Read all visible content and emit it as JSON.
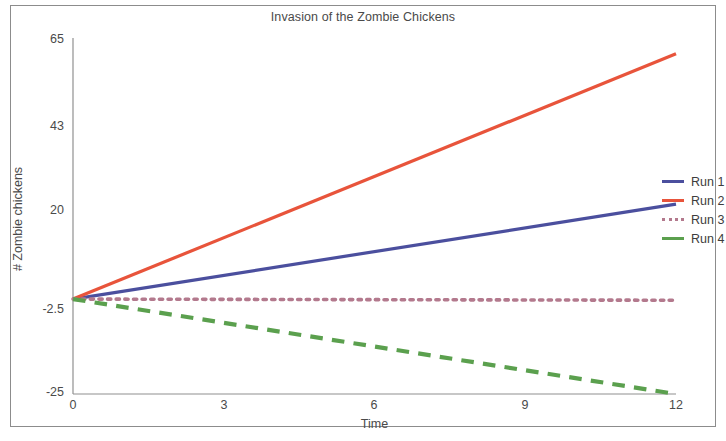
{
  "chart_data": {
    "type": "line",
    "title": "Invasion of the Zombie Chickens",
    "xlabel": "Time",
    "ylabel": "# Zombie chickens",
    "xlim": [
      0,
      12
    ],
    "ylim": [
      -25,
      65
    ],
    "xticks": [
      "0",
      "3",
      "6",
      "9",
      "12"
    ],
    "xtick_values": [
      0,
      3,
      6,
      9,
      12
    ],
    "yticks": [
      "-25",
      "-2.5",
      "20",
      "43",
      "65"
    ],
    "ytick_values": [
      -25,
      -2.5,
      20,
      43,
      65
    ],
    "grid": false,
    "legend_position": "right",
    "x": [
      0,
      12
    ],
    "series": [
      {
        "name": "Run 1",
        "values": [
          -1,
          23
        ],
        "color": "#4b4f9e",
        "style": "solid"
      },
      {
        "name": "Run 2",
        "values": [
          -1,
          61
        ],
        "color": "#e8543b",
        "style": "solid"
      },
      {
        "name": "Run 3",
        "values": [
          -1,
          -1.3
        ],
        "color": "#b3798d",
        "style": "dotted"
      },
      {
        "name": "Run 4",
        "values": [
          -1,
          -25
        ],
        "color": "#5ba04e",
        "style": "dashed"
      }
    ]
  },
  "legend": {
    "items": [
      {
        "label": "Run 1"
      },
      {
        "label": "Run 2"
      },
      {
        "label": "Run 3"
      },
      {
        "label": "Run 4"
      }
    ]
  },
  "axes": {
    "ytick_labels": [
      "65",
      "43",
      "20",
      "-2.5",
      "-25"
    ],
    "xtick_labels": [
      "0",
      "3",
      "6",
      "9",
      "12"
    ]
  }
}
